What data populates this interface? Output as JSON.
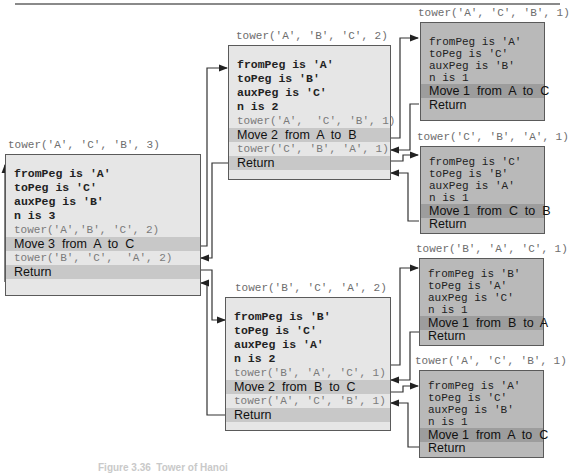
{
  "figure": {
    "caption": "Figure 3.36  Tower of Hanoi"
  },
  "frames": {
    "root": {
      "call": "tower('A', 'C', 'B', 3)",
      "lines": [
        "fromPeg is 'A'",
        "toPeg is 'C'",
        "auxPeg is 'B'",
        "n is 3"
      ],
      "call1": "tower('A','B', 'C', 2)",
      "move": "Move 3  from  A  to  C",
      "call2": "tower('B', 'C',  'A', 2)",
      "return": "Return"
    },
    "left2": {
      "call": "tower('A', 'B', 'C', 2)",
      "lines": [
        "fromPeg is 'A'",
        "toPeg is 'B'",
        "auxPeg is 'C'",
        "n is 2"
      ],
      "call1": "tower('A',  'C', 'B', 1)",
      "move": "Move 2  from  A  to  B",
      "call2": "tower('C', 'B', 'A', 1)",
      "return": "Return"
    },
    "right2": {
      "call": "tower('B', 'C', 'A', 2)",
      "lines": [
        "fromPeg is 'B'",
        "toPeg is 'C'",
        "auxPeg is 'A'",
        "n is 2"
      ],
      "call1": "tower('B', 'A', 'C', 1)",
      "move": "Move 2  from  B  to  C",
      "call2": "tower('A', 'C', 'B', 1)",
      "return": "Return"
    },
    "leaf1": {
      "call": "tower('A', 'C', 'B', 1)",
      "lines": [
        "fromPeg is 'A'",
        "toPeg is 'C'",
        "auxPeg is 'B'",
        "n is 1"
      ],
      "move": "Move 1  from  A  to  C",
      "return": "Return"
    },
    "leaf2": {
      "call": "tower('C', 'B', 'A', 1)",
      "lines": [
        "fromPeg is 'C'",
        "toPeg is 'B'",
        "auxPeg is 'A'",
        "n is 1"
      ],
      "move": "Move 1  from  C  to  B",
      "return": "Return"
    },
    "leaf3": {
      "call": "tower('B', 'A', 'C', 1)",
      "lines": [
        "fromPeg is 'B'",
        "toPeg is 'A'",
        "auxPeg is 'C'",
        "n is 1"
      ],
      "move": "Move 1  from  B  to  A",
      "return": "Return"
    },
    "leaf4": {
      "call": "tower('A', 'C', 'B', 1)",
      "lines": [
        "fromPeg is 'A'",
        "toPeg is 'C'",
        "auxPeg is 'B'",
        "n is 1"
      ],
      "move": "Move 1  from  A  to  C",
      "return": "Return"
    }
  },
  "colors": {
    "frame_light": "#e6e6e6",
    "frame_dark": "#b9b9b9",
    "highlight_band": "#c8c8c8",
    "call_text": "#7a7a7a",
    "connector": "#333333"
  }
}
